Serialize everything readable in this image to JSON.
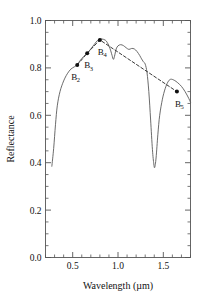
{
  "chart_data": {
    "type": "line",
    "title": "",
    "xlabel": "Wavelength (µm)",
    "ylabel": "Reflectance",
    "xlim": [
      0.2,
      1.8
    ],
    "ylim": [
      0.0,
      1.0
    ],
    "xticks": [
      0.5,
      1.0,
      1.5
    ],
    "xticklabels": [
      "0.5",
      "1.0",
      "1.5"
    ],
    "xminorticks": [
      0.2,
      0.3,
      0.4,
      0.6,
      0.7,
      0.8,
      0.9,
      1.1,
      1.2,
      1.3,
      1.4,
      1.6,
      1.7,
      1.8
    ],
    "yticks": [
      0.0,
      0.2,
      0.4,
      0.6,
      0.8,
      1.0
    ],
    "yticklabels": [
      "0.0",
      "0.2",
      "0.4",
      "0.6",
      "0.8",
      "1.0"
    ],
    "yminorticks": [
      0.05,
      0.1,
      0.15,
      0.25,
      0.3,
      0.35,
      0.45,
      0.5,
      0.55,
      0.65,
      0.7,
      0.75,
      0.85,
      0.9,
      0.95
    ],
    "grid": false,
    "legend": null,
    "series": [
      {
        "name": "spectral-reflectance-curve",
        "style": "solid",
        "x": [
          0.27,
          0.29,
          0.31,
          0.33,
          0.36,
          0.4,
          0.44,
          0.48,
          0.52,
          0.55,
          0.58,
          0.62,
          0.66,
          0.7,
          0.74,
          0.78,
          0.82,
          0.86,
          0.88,
          0.9,
          0.92,
          0.935,
          0.95,
          0.965,
          0.98,
          1.0,
          1.03,
          1.06,
          1.09,
          1.12,
          1.15,
          1.18,
          1.21,
          1.24,
          1.26,
          1.28,
          1.3,
          1.32,
          1.34,
          1.36,
          1.38,
          1.395,
          1.405,
          1.42,
          1.44,
          1.46,
          1.49,
          1.52,
          1.55,
          1.58,
          1.62,
          1.66,
          1.7,
          1.74,
          1.78,
          1.8
        ],
        "y": [
          0.385,
          0.46,
          0.56,
          0.64,
          0.7,
          0.745,
          0.775,
          0.795,
          0.805,
          0.815,
          0.83,
          0.848,
          0.862,
          0.88,
          0.9,
          0.918,
          0.922,
          0.917,
          0.908,
          0.893,
          0.872,
          0.852,
          0.836,
          0.855,
          0.88,
          0.893,
          0.898,
          0.894,
          0.885,
          0.878,
          0.882,
          0.88,
          0.869,
          0.852,
          0.838,
          0.826,
          0.816,
          0.78,
          0.7,
          0.58,
          0.455,
          0.395,
          0.38,
          0.42,
          0.52,
          0.6,
          0.668,
          0.712,
          0.74,
          0.752,
          0.748,
          0.737,
          0.722,
          0.7,
          0.672,
          0.655
        ]
      },
      {
        "name": "band-connector-dashed",
        "style": "dashed",
        "x": [
          0.55,
          0.66,
          0.8,
          1.65
        ],
        "y": [
          0.812,
          0.862,
          0.918,
          0.7
        ]
      }
    ],
    "points": [
      {
        "id": "B2",
        "label": "B",
        "sub": "2",
        "x": 0.55,
        "y": 0.812,
        "label_dx": -3,
        "label_dy": 15
      },
      {
        "id": "B3",
        "label": "B",
        "sub": "3",
        "x": 0.66,
        "y": 0.862,
        "label_dx": 0,
        "label_dy": 15
      },
      {
        "id": "B4",
        "label": "B",
        "sub": "4",
        "x": 0.8,
        "y": 0.918,
        "label_dx": 1,
        "label_dy": 15
      },
      {
        "id": "B5",
        "label": "B",
        "sub": "5",
        "x": 1.65,
        "y": 0.7,
        "label_dx": 1,
        "label_dy": 15
      }
    ],
    "colors": {
      "curve": "#5a5a5a",
      "dashed": "#3a3a3a",
      "marker": "#111111",
      "axis": "#555555",
      "text": "#111111"
    }
  }
}
